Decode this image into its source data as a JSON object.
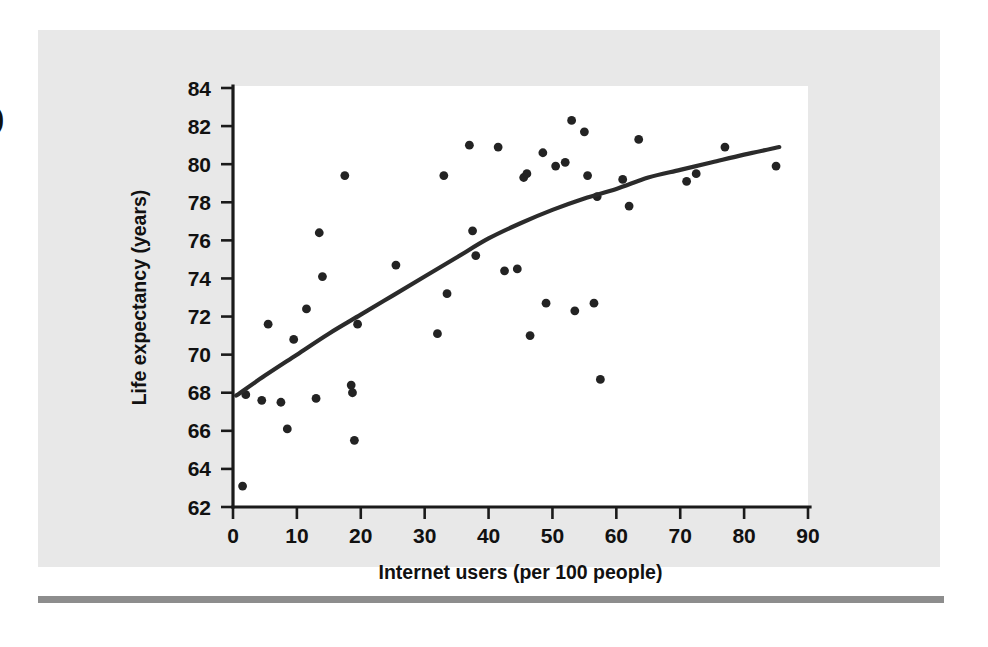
{
  "figure": {
    "margin_glyph": ")",
    "background_color": "#e8e8e8",
    "plot_background_color": "#ffffff",
    "rule_color": "#8d8d8d"
  },
  "chart_data": {
    "type": "scatter",
    "title": "",
    "xlabel": "Internet users (per 100 people)",
    "ylabel": "Life expectancy (years)",
    "xlim": [
      0,
      90
    ],
    "ylim": [
      62,
      84
    ],
    "xticks": [
      0,
      10,
      20,
      30,
      40,
      50,
      60,
      70,
      80,
      90
    ],
    "yticks": [
      62,
      64,
      66,
      68,
      70,
      72,
      74,
      76,
      78,
      80,
      82,
      84
    ],
    "xtick_labels": [
      "0",
      "10",
      "20",
      "30",
      "40",
      "50",
      "60",
      "70",
      "80",
      "90"
    ],
    "ytick_labels": [
      "62",
      "64",
      "66",
      "68",
      "70",
      "72",
      "74",
      "76",
      "78",
      "80",
      "82",
      "84"
    ],
    "grid": false,
    "legend": null,
    "marker_color": "#232323",
    "trend_color": "#2b2b2b",
    "points": [
      {
        "x": 1.5,
        "y": 63.1
      },
      {
        "x": 2.0,
        "y": 67.9
      },
      {
        "x": 4.5,
        "y": 67.6
      },
      {
        "x": 5.5,
        "y": 71.6
      },
      {
        "x": 7.5,
        "y": 67.5
      },
      {
        "x": 8.5,
        "y": 66.1
      },
      {
        "x": 9.5,
        "y": 70.8
      },
      {
        "x": 11.5,
        "y": 72.4
      },
      {
        "x": 13.0,
        "y": 67.7
      },
      {
        "x": 13.5,
        "y": 76.4
      },
      {
        "x": 14.0,
        "y": 74.1
      },
      {
        "x": 17.5,
        "y": 79.4
      },
      {
        "x": 18.5,
        "y": 68.4
      },
      {
        "x": 18.7,
        "y": 68.0
      },
      {
        "x": 19.0,
        "y": 65.5
      },
      {
        "x": 19.5,
        "y": 71.6
      },
      {
        "x": 25.5,
        "y": 74.7
      },
      {
        "x": 32.0,
        "y": 71.1
      },
      {
        "x": 33.0,
        "y": 79.4
      },
      {
        "x": 33.5,
        "y": 73.2
      },
      {
        "x": 37.0,
        "y": 81.0
      },
      {
        "x": 37.5,
        "y": 76.5
      },
      {
        "x": 38.0,
        "y": 75.2
      },
      {
        "x": 41.5,
        "y": 80.9
      },
      {
        "x": 42.5,
        "y": 74.4
      },
      {
        "x": 44.5,
        "y": 74.5
      },
      {
        "x": 45.5,
        "y": 79.3
      },
      {
        "x": 46.0,
        "y": 79.5
      },
      {
        "x": 46.5,
        "y": 71.0
      },
      {
        "x": 48.5,
        "y": 80.6
      },
      {
        "x": 49.0,
        "y": 72.7
      },
      {
        "x": 50.5,
        "y": 79.9
      },
      {
        "x": 52.0,
        "y": 80.1
      },
      {
        "x": 53.0,
        "y": 82.3
      },
      {
        "x": 53.5,
        "y": 72.3
      },
      {
        "x": 55.0,
        "y": 81.7
      },
      {
        "x": 55.5,
        "y": 79.4
      },
      {
        "x": 56.5,
        "y": 72.7
      },
      {
        "x": 57.0,
        "y": 78.3
      },
      {
        "x": 57.5,
        "y": 68.7
      },
      {
        "x": 61.0,
        "y": 79.2
      },
      {
        "x": 62.0,
        "y": 77.8
      },
      {
        "x": 63.5,
        "y": 81.3
      },
      {
        "x": 71.0,
        "y": 79.1
      },
      {
        "x": 72.5,
        "y": 79.5
      },
      {
        "x": 77.0,
        "y": 80.9
      },
      {
        "x": 85.0,
        "y": 79.9
      }
    ],
    "trend": {
      "description": "smooth increasing curve",
      "points": [
        {
          "x": 0.5,
          "y": 67.85
        },
        {
          "x": 5,
          "y": 68.9
        },
        {
          "x": 10,
          "y": 70.0
        },
        {
          "x": 15,
          "y": 71.1
        },
        {
          "x": 20,
          "y": 72.1
        },
        {
          "x": 25,
          "y": 73.1
        },
        {
          "x": 30,
          "y": 74.1
        },
        {
          "x": 35,
          "y": 75.1
        },
        {
          "x": 40,
          "y": 76.1
        },
        {
          "x": 45,
          "y": 76.9
        },
        {
          "x": 50,
          "y": 77.6
        },
        {
          "x": 55,
          "y": 78.2
        },
        {
          "x": 60,
          "y": 78.7
        },
        {
          "x": 65,
          "y": 79.3
        },
        {
          "x": 70,
          "y": 79.7
        },
        {
          "x": 75,
          "y": 80.1
        },
        {
          "x": 80,
          "y": 80.5
        },
        {
          "x": 85.5,
          "y": 80.9
        }
      ]
    }
  }
}
